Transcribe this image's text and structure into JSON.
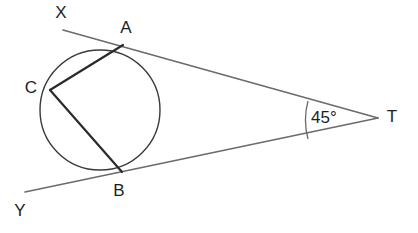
{
  "figure": {
    "background": "#ffffff",
    "width": 418,
    "height": 233,
    "colors": {
      "tangent_line": "#6b6b6b",
      "chord": "#2a2a2a",
      "circle": "#3a3a3a",
      "label_text": "#1d1d1d",
      "angle_arc": "#6b6b6b"
    },
    "circle": {
      "cx": 100,
      "cy": 110,
      "r": 60,
      "stroke_width": 1.4
    },
    "points": {
      "X": {
        "label": "X",
        "x": 63,
        "y": 30,
        "label_x": 61,
        "label_y": 14
      },
      "A": {
        "label": "A",
        "x": 123,
        "y": 45,
        "label_x": 126,
        "label_y": 29
      },
      "C": {
        "label": "C",
        "x": 50,
        "y": 90,
        "label_x": 31,
        "label_y": 89
      },
      "B": {
        "label": "B",
        "x": 122,
        "y": 172,
        "label_x": 119,
        "label_y": 192
      },
      "Y": {
        "label": "Y",
        "x": 25,
        "y": 192,
        "label_x": 20,
        "label_y": 212
      },
      "T": {
        "label": "T",
        "x": 378,
        "y": 118,
        "label_x": 392,
        "label_y": 118
      }
    },
    "tangents": [
      {
        "name": "tangent-XT",
        "from": "X",
        "through": "A",
        "to": "T",
        "stroke_width": 1.6
      },
      {
        "name": "tangent-YT",
        "from": "Y",
        "through": "B",
        "to": "T",
        "stroke_width": 1.6
      }
    ],
    "chords": [
      {
        "name": "chord-AC",
        "from": "A",
        "to": "C",
        "stroke_width": 2.2
      },
      {
        "name": "chord-CB",
        "from": "C",
        "to": "B",
        "stroke_width": 2.2
      }
    ],
    "angle": {
      "vertex": "T",
      "label": "45°",
      "value": 45,
      "unit": "degrees",
      "label_x": 311,
      "label_y": 119,
      "arc_start_x": 308,
      "arc_start_y": 101,
      "arc_end_x": 308,
      "arc_end_y": 139,
      "arc_radius": 73
    }
  }
}
